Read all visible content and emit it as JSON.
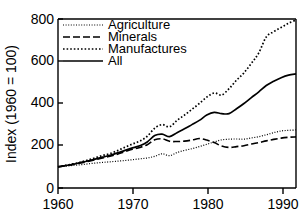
{
  "chart_data": {
    "type": "line",
    "title": "",
    "xlabel": "",
    "ylabel": "Index (1960 = 100)",
    "xlim": [
      1960,
      1992
    ],
    "ylim": [
      0,
      800
    ],
    "grid": false,
    "legend_position": "top-left",
    "xticks": [
      1960,
      1970,
      1980,
      1990
    ],
    "xtick_labels": [
      "1960",
      "1970",
      "1980",
      "1990"
    ],
    "yticks": [
      0,
      200,
      400,
      600,
      800
    ],
    "ytick_labels": [
      "0",
      "200",
      "400",
      "600",
      "800"
    ],
    "x": [
      1960,
      1961,
      1962,
      1963,
      1964,
      1965,
      1966,
      1967,
      1968,
      1969,
      1970,
      1971,
      1972,
      1973,
      1974,
      1975,
      1976,
      1977,
      1978,
      1979,
      1980,
      1981,
      1982,
      1983,
      1984,
      1985,
      1986,
      1987,
      1988,
      1989,
      1990,
      1991,
      1992
    ],
    "series": [
      {
        "name": "Agriculture",
        "line_style": "fine-dotted",
        "values": [
          100,
          103,
          107,
          110,
          114,
          118,
          121,
          124,
          127,
          130,
          134,
          138,
          142,
          150,
          162,
          153,
          168,
          178,
          186,
          196,
          207,
          218,
          228,
          231,
          232,
          231,
          237,
          243,
          252,
          262,
          270,
          273,
          275
        ]
      },
      {
        "name": "Minerals",
        "line_style": "dashed",
        "values": [
          100,
          106,
          112,
          118,
          126,
          134,
          142,
          150,
          160,
          172,
          183,
          192,
          205,
          228,
          233,
          221,
          220,
          222,
          227,
          234,
          227,
          215,
          199,
          192,
          196,
          200,
          208,
          215,
          223,
          230,
          236,
          240,
          242
        ]
      },
      {
        "name": "Manufactures",
        "line_style": "dotted",
        "values": [
          100,
          107,
          114,
          122,
          132,
          143,
          154,
          163,
          177,
          193,
          208,
          222,
          245,
          283,
          300,
          290,
          320,
          345,
          372,
          400,
          430,
          450,
          440,
          470,
          510,
          545,
          590,
          640,
          715,
          740,
          760,
          780,
          795
        ]
      },
      {
        "name": "All",
        "line_style": "solid",
        "values": [
          100,
          106,
          112,
          120,
          128,
          137,
          146,
          155,
          166,
          178,
          190,
          200,
          218,
          248,
          255,
          243,
          262,
          280,
          300,
          320,
          345,
          358,
          352,
          352,
          375,
          400,
          428,
          455,
          485,
          505,
          522,
          534,
          540
        ]
      }
    ],
    "legend_entries": [
      {
        "label": "Agriculture",
        "line_style": "fine-dotted"
      },
      {
        "label": "Minerals",
        "line_style": "dashed"
      },
      {
        "label": "Manufactures",
        "line_style": "dotted"
      },
      {
        "label": "All",
        "line_style": "solid"
      }
    ],
    "colors": {
      "axis": "#000000",
      "series": "#000000",
      "background": "#ffffff"
    }
  }
}
